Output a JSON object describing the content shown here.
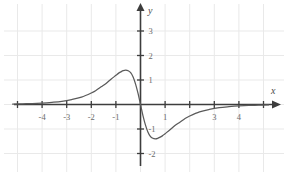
{
  "chart_data": {
    "type": "line",
    "title": "",
    "xlabel": "x",
    "ylabel": "y",
    "grid": true,
    "legend": "none",
    "xlim": [
      -5.2,
      5.4
    ],
    "ylim": [
      -2.6,
      3.6
    ],
    "xticks": [
      -4,
      -3,
      -2,
      -1,
      1,
      3,
      4
    ],
    "xtick_labels": [
      "-4",
      "-3",
      "-2",
      "-1",
      "1",
      "3",
      "4"
    ],
    "yticks": [
      3,
      2,
      1,
      -1,
      -2
    ],
    "ytick_labels": [
      "3",
      "2",
      "1",
      "-1",
      "-2"
    ],
    "axis_arrows": [
      "x-positive",
      "y-positive"
    ],
    "series": [
      {
        "name": "curve",
        "color": "#5a5a5a",
        "x": [
          -5.2,
          -4.8,
          -4.4,
          -4.0,
          -3.6,
          -3.2,
          -2.8,
          -2.4,
          -2.0,
          -1.8,
          -1.6,
          -1.4,
          -1.2,
          -1.0,
          -0.9,
          -0.8,
          -0.7,
          -0.6,
          -0.5,
          -0.4,
          -0.3,
          -0.2,
          -0.1,
          0.0,
          0.1,
          0.2,
          0.3,
          0.4,
          0.5,
          0.6,
          0.7,
          0.8,
          0.9,
          1.0,
          1.2,
          1.4,
          1.6,
          1.8,
          2.0,
          2.4,
          2.8,
          3.2,
          3.6,
          4.0,
          4.4,
          4.8,
          5.2
        ],
        "y": [
          0.02,
          0.03,
          0.04,
          0.06,
          0.09,
          0.13,
          0.2,
          0.3,
          0.47,
          0.58,
          0.72,
          0.86,
          1.03,
          1.19,
          1.27,
          1.33,
          1.38,
          1.4,
          1.38,
          1.3,
          1.12,
          0.83,
          0.45,
          0.0,
          -0.45,
          -0.83,
          -1.12,
          -1.3,
          -1.38,
          -1.4,
          -1.38,
          -1.33,
          -1.27,
          -1.19,
          -1.03,
          -0.86,
          -0.72,
          -0.58,
          -0.47,
          -0.3,
          -0.2,
          -0.13,
          -0.09,
          -0.06,
          -0.04,
          -0.03,
          -0.02
        ]
      }
    ],
    "annotations": [
      {
        "name": "local-maximum",
        "x": -0.6,
        "y": 1.4
      },
      {
        "name": "local-minimum",
        "x": 0.6,
        "y": -1.4
      },
      {
        "name": "origin-crossing",
        "x": 0,
        "y": 0
      }
    ]
  },
  "colors": {
    "curve": "#5a5a5a",
    "axis": "#3d3d3d",
    "grid": "#e8e8e8",
    "tick_text": "#6b6b6b",
    "background": "#ffffff"
  }
}
